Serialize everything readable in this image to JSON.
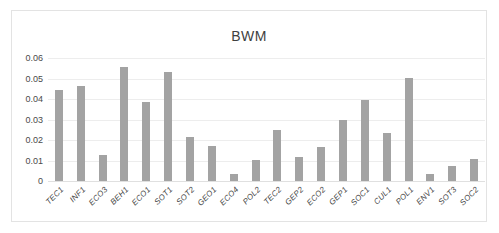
{
  "top_caption": {
    "text": "",
    "note": "illegible cut-off caption remnant"
  },
  "chart": {
    "title": "BWM"
  },
  "chart_data": {
    "type": "bar",
    "title": "BWM",
    "xlabel": "",
    "ylabel": "",
    "ylim": [
      0,
      0.06
    ],
    "yticks": [
      "0",
      "0.01",
      "0.02",
      "0.03",
      "0.04",
      "0.05",
      "0.06"
    ],
    "ytick_values": [
      0,
      0.01,
      0.02,
      0.03,
      0.04,
      0.05,
      0.06
    ],
    "grid": true,
    "legend": false,
    "bar_color": "#a3a3a3",
    "categories": [
      "TEC1",
      "INF1",
      "ECO3",
      "BEH1",
      "ECO1",
      "SOT1",
      "SOT2",
      "GEO1",
      "ECO4",
      "POL2",
      "TEC2",
      "GEP2",
      "ECO2",
      "GEP1",
      "SOC1",
      "CUL1",
      "POL1",
      "ENV1",
      "SOT3",
      "SOC2"
    ],
    "values": [
      0.0445,
      0.0465,
      0.0127,
      0.0555,
      0.0387,
      0.0532,
      0.0213,
      0.0172,
      0.0033,
      0.0103,
      0.025,
      0.0117,
      0.0165,
      0.0298,
      0.0396,
      0.0236,
      0.0503,
      0.0032,
      0.0073,
      0.0108
    ]
  }
}
